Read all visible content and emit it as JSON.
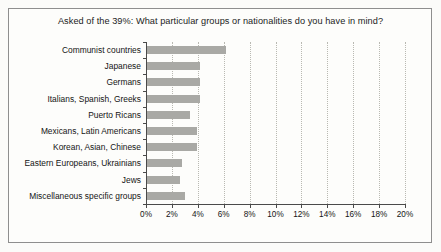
{
  "chart_data": {
    "type": "bar",
    "orientation": "horizontal",
    "title": "Asked of the 39%: What particular groups or nationalities do you have in mind?",
    "xlabel": "",
    "ylabel": "",
    "categories": [
      "Communist countries",
      "Japanese",
      "Germans",
      "Italians, Spanish, Greeks",
      "Puerto Ricans",
      "Mexicans, Latin Americans",
      "Korean, Asian, Chinese",
      "Eastern Europeans, Ukrainians",
      "Jews",
      "Miscellaneous specific groups"
    ],
    "values": [
      6.2,
      4.2,
      4.2,
      4.2,
      3.4,
      3.9,
      3.9,
      2.8,
      2.6,
      3.0
    ],
    "value_unit": "%",
    "xlim": [
      0,
      20
    ],
    "xtick_values": [
      0,
      2,
      4,
      6,
      8,
      10,
      12,
      14,
      16,
      18,
      20
    ],
    "xtick_labels": [
      "0%",
      "2%",
      "4%",
      "6%",
      "8%",
      "10%",
      "12%",
      "14%",
      "16%",
      "18%",
      "20%"
    ],
    "grid": "vertical-dotted",
    "legend": null,
    "bar_color": "#a9a9a5",
    "axis_color": "#4a4a4a",
    "gridline_color": "#b9b9b2",
    "background_color": "#fdfdfb",
    "frame_color": "#8e8e8e"
  }
}
